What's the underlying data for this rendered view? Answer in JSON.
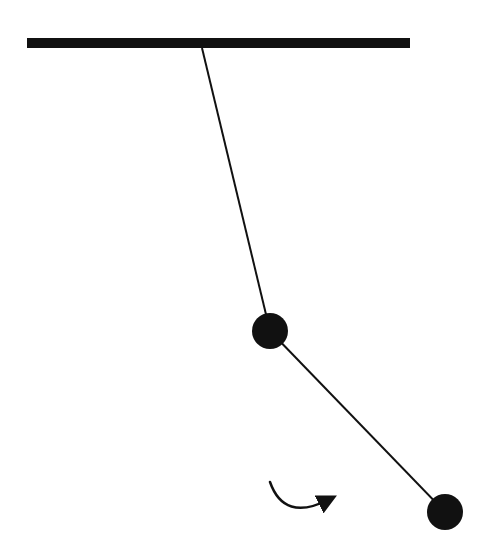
{
  "diagram": {
    "type": "double-pendulum",
    "width": 492,
    "height": 551,
    "background": "#ffffff",
    "ink_color": "#111111",
    "ceiling": {
      "x1": 27,
      "y1": 43,
      "x2": 410,
      "y2": 43,
      "thickness": 10
    },
    "pivot": {
      "x": 202,
      "y": 48
    },
    "rod1": {
      "x1": 202,
      "y1": 48,
      "x2": 270,
      "y2": 331,
      "thickness": 2
    },
    "bob1": {
      "cx": 270,
      "cy": 331,
      "r": 18
    },
    "rod2": {
      "x1": 270,
      "y1": 331,
      "x2": 445,
      "y2": 512,
      "thickness": 2
    },
    "bob2": {
      "cx": 445,
      "cy": 512,
      "r": 18
    },
    "rotation_arrow": {
      "direction": "counterclockwise-swing",
      "path": "M 270 482 Q 284 522 328 500",
      "thickness": 2.5
    }
  }
}
